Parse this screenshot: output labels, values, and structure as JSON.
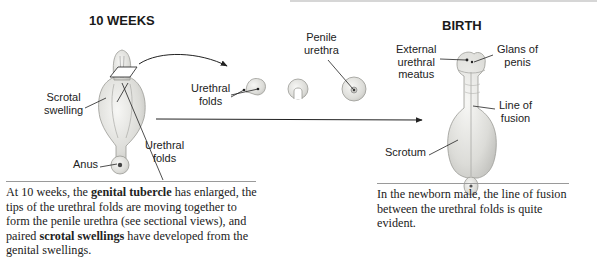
{
  "left_panel": {
    "title": "10 WEEKS",
    "labels": {
      "scrotal_swelling": [
        "Scrotal",
        "swelling"
      ],
      "anus": "Anus",
      "urethral_folds_main": [
        "Urethral",
        "folds"
      ],
      "urethral_folds_section": [
        "Urethral",
        "folds"
      ],
      "penile_urethra": [
        "Penile",
        "urethra"
      ]
    },
    "caption": {
      "parts": [
        {
          "text": "At 10 weeks, the ",
          "bold": false
        },
        {
          "text": "genital tubercle",
          "bold": true
        },
        {
          "text": " has enlarged, the tips of the urethral folds are moving together to form the penile urethra (see sectional views), and paired ",
          "bold": false
        },
        {
          "text": "scrotal swellings",
          "bold": true
        },
        {
          "text": " have developed from the genital swellings.",
          "bold": false
        }
      ]
    }
  },
  "right_panel": {
    "title": "BIRTH",
    "labels": {
      "external_urethral_meatus": [
        "External",
        "urethral",
        "meatus"
      ],
      "glans_of_penis": [
        "Glans of",
        "penis"
      ],
      "line_of_fusion": [
        "Line of",
        "fusion"
      ],
      "scrotum": "Scrotum"
    },
    "caption": "In the newborn male, the line of fusion between the urethral folds is quite evident."
  },
  "colors": {
    "tissue_fill": "#e6e6e4",
    "tissue_stroke": "#9a9a96",
    "leader_line": "#222222",
    "rule": "#9a9a9a"
  }
}
